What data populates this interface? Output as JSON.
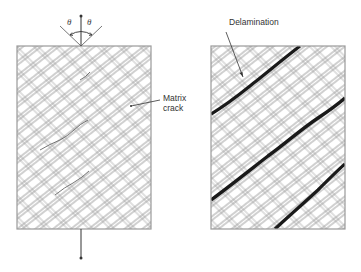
{
  "figure": {
    "left_panel": {
      "name": "specimen-with-matrix-cracks",
      "label_matrix_crack_line1": "Matrix",
      "label_matrix_crack_line2": "crack",
      "angle_symbol_left": "θ",
      "angle_symbol_right": "θ",
      "load_arrow_top": "tension-arrow-up",
      "load_arrow_bottom": "tension-arrow-down"
    },
    "right_panel": {
      "name": "specimen-with-delamination",
      "label_delamination": "Delamination"
    },
    "colors": {
      "line": "#8a8a8a",
      "border": "#9a9a9a",
      "delamination": "#1a1a1a",
      "text": "#333333"
    }
  }
}
